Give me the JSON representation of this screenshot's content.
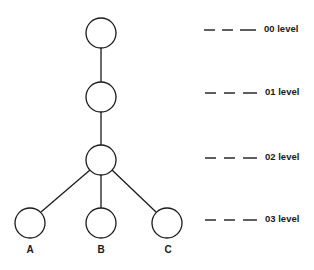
{
  "diagram": {
    "type": "tree",
    "nodes": [
      {
        "id": "n00",
        "level": "00",
        "label": ""
      },
      {
        "id": "n01",
        "level": "01",
        "label": ""
      },
      {
        "id": "n02",
        "level": "02",
        "label": ""
      },
      {
        "id": "A",
        "level": "03",
        "label": "A"
      },
      {
        "id": "B",
        "level": "03",
        "label": "B"
      },
      {
        "id": "C",
        "level": "03",
        "label": "C"
      }
    ],
    "edges": [
      [
        "n00",
        "n01"
      ],
      [
        "n01",
        "n02"
      ],
      [
        "n02",
        "A"
      ],
      [
        "n02",
        "B"
      ],
      [
        "n02",
        "C"
      ]
    ],
    "levels": [
      {
        "label": "00 level"
      },
      {
        "label": "01 level"
      },
      {
        "label": "02 level"
      },
      {
        "label": "03 level"
      }
    ],
    "leaf_labels": [
      "A",
      "B",
      "C"
    ]
  }
}
